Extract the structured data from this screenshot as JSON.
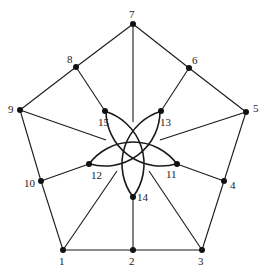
{
  "diagram": {
    "type": "geometric-graph",
    "nodes": [
      {
        "id": "1",
        "label": "1",
        "x": 63,
        "y": 250,
        "lx": 59,
        "ly": 256
      },
      {
        "id": "2",
        "label": "2",
        "x": 133,
        "y": 250,
        "lx": 129,
        "ly": 256
      },
      {
        "id": "3",
        "label": "3",
        "x": 202,
        "y": 250,
        "lx": 198,
        "ly": 256
      },
      {
        "id": "4",
        "label": "4",
        "x": 224,
        "y": 181,
        "lx": 230,
        "ly": 180
      },
      {
        "id": "5",
        "label": "5",
        "x": 246,
        "y": 112,
        "lx": 253,
        "ly": 103
      },
      {
        "id": "6",
        "label": "6",
        "x": 189,
        "y": 68,
        "lx": 192,
        "ly": 55
      },
      {
        "id": "7",
        "label": "7",
        "x": 133,
        "y": 24,
        "lx": 129,
        "ly": 9
      },
      {
        "id": "8",
        "label": "8",
        "x": 76,
        "y": 67,
        "lx": 67,
        "ly": 54
      },
      {
        "id": "9",
        "label": "9",
        "x": 20,
        "y": 110,
        "lx": 8,
        "ly": 104
      },
      {
        "id": "10",
        "label": "10",
        "x": 41,
        "y": 181,
        "lx": 24,
        "ly": 178
      },
      {
        "id": "11",
        "label": "11",
        "x": 177,
        "y": 164,
        "lx": 166,
        "ly": 169
      },
      {
        "id": "12",
        "label": "12",
        "x": 89,
        "y": 164,
        "lx": 91,
        "ly": 170
      },
      {
        "id": "13",
        "label": "13",
        "x": 161,
        "y": 111,
        "lx": 160,
        "ly": 117
      },
      {
        "id": "14",
        "label": "14",
        "x": 133,
        "y": 197,
        "lx": 137,
        "ly": 192
      },
      {
        "id": "15",
        "label": "15",
        "x": 105,
        "y": 111,
        "lx": 98,
        "ly": 117
      }
    ],
    "edges": [
      {
        "from": "1",
        "to": "2"
      },
      {
        "from": "2",
        "to": "3"
      },
      {
        "from": "3",
        "to": "4"
      },
      {
        "from": "4",
        "to": "5"
      },
      {
        "from": "5",
        "to": "6"
      },
      {
        "from": "6",
        "to": "7"
      },
      {
        "from": "7",
        "to": "8"
      },
      {
        "from": "8",
        "to": "9"
      },
      {
        "from": "9",
        "to": "10"
      },
      {
        "from": "10",
        "to": "1"
      },
      {
        "from": "2",
        "to": "14"
      },
      {
        "from": "4",
        "to": "11"
      },
      {
        "from": "6",
        "to": "13"
      },
      {
        "from": "8",
        "to": "15"
      },
      {
        "from": "10",
        "to": "12"
      }
    ],
    "spokes": [
      {
        "from": "1",
        "x2": 117,
        "y2": 171
      },
      {
        "from": "3",
        "x2": 149,
        "y2": 171
      },
      {
        "from": "5",
        "x2": 160,
        "y2": 140
      },
      {
        "from": "7",
        "x2": 133,
        "y2": 122
      },
      {
        "from": "9",
        "x2": 106,
        "y2": 140
      }
    ],
    "arcs": [
      {
        "center": "12",
        "cx": 89,
        "cy": 164,
        "r": 55,
        "from": "15",
        "to": "14"
      },
      {
        "center": "14",
        "cx": 133,
        "cy": 197,
        "r": 55,
        "from": "12",
        "to": "11"
      },
      {
        "center": "11",
        "cx": 177,
        "cy": 164,
        "r": 55,
        "from": "14",
        "to": "13"
      },
      {
        "center": "13",
        "cx": 161,
        "cy": 111,
        "r": 55,
        "from": "11",
        "to": "15"
      },
      {
        "center": "15",
        "cx": 105,
        "cy": 111,
        "r": 55,
        "from": "13",
        "to": "12"
      }
    ],
    "colors": {
      "stroke": "#1a1a1a",
      "node": "#111111",
      "background": "#ffffff"
    }
  }
}
